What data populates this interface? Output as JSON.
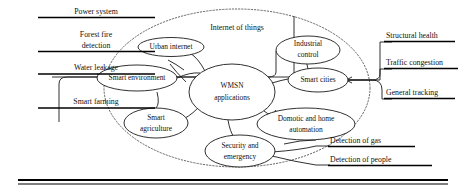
{
  "figure": {
    "title": "Internet of things",
    "boundary_label": "Internet of things",
    "boundary_style": "dotted-ellipse"
  },
  "central_node": {
    "line1": "WMSN",
    "line2": "applications"
  },
  "domain_nodes": [
    {
      "id": "urban-internet",
      "line1": "Urban internet",
      "line2": ""
    },
    {
      "id": "industrial-control",
      "line1": "Industrial",
      "line2": "control"
    },
    {
      "id": "smart-environment",
      "line1": "Smart environment",
      "line2": ""
    },
    {
      "id": "smart-cities",
      "line1": "Smart cities",
      "line2": ""
    },
    {
      "id": "smart-agriculture",
      "line1": "Smart",
      "line2": "agriculture"
    },
    {
      "id": "domotic-home-automation",
      "line1": "Domotic and home",
      "line2": "automation"
    },
    {
      "id": "security-emergency",
      "line1": "Security and",
      "line2": "emergency"
    }
  ],
  "left_labels": [
    {
      "id": "power-system",
      "text": "Power system"
    },
    {
      "id": "forest-fire-detection",
      "line1": "Forest fire",
      "line2": "detection",
      "text": "Forest fire detection"
    },
    {
      "id": "water-leakage",
      "text": "Water leakage"
    },
    {
      "id": "smart-farming",
      "text": "Smart farming"
    }
  ],
  "right_labels": [
    {
      "id": "structural-health",
      "text": "Structural health"
    },
    {
      "id": "traffic-congestion",
      "text": "Traffic congestion"
    },
    {
      "id": "general-tracking",
      "text": "General tracking"
    },
    {
      "id": "detection-of-gas",
      "text": "Detection of gas"
    },
    {
      "id": "detection-of-people",
      "text": "Detection of people"
    }
  ],
  "colors": {
    "ink": "#111111",
    "stroke": "#1a1a1a",
    "dotted": "#555555",
    "background": "#ffffff"
  }
}
